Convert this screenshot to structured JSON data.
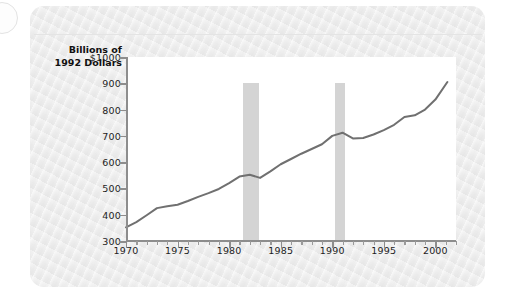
{
  "chart_data": {
    "type": "line",
    "title": "",
    "xlabel": "",
    "ylabel_lines": [
      "Billions of",
      "1992 Dollars"
    ],
    "xlim": [
      1970,
      2002
    ],
    "ylim": [
      300,
      1000
    ],
    "grid": false,
    "legend": null,
    "y_ticks": [
      {
        "value": 1000,
        "label": "$1000"
      },
      {
        "value": 900,
        "label": "900"
      },
      {
        "value": 800,
        "label": "800"
      },
      {
        "value": 700,
        "label": "700"
      },
      {
        "value": 600,
        "label": "600"
      },
      {
        "value": 500,
        "label": "500"
      },
      {
        "value": 400,
        "label": "400"
      },
      {
        "value": 300,
        "label": "300"
      }
    ],
    "x_ticks": [
      {
        "value": 1970,
        "label": "1970"
      },
      {
        "value": 1975,
        "label": "1975"
      },
      {
        "value": 1980,
        "label": "1980"
      },
      {
        "value": 1985,
        "label": "1985"
      },
      {
        "value": 1990,
        "label": "1990"
      },
      {
        "value": 1995,
        "label": "1995"
      },
      {
        "value": 2000,
        "label": "2000"
      }
    ],
    "x_minor_tick_step": 1,
    "series": [
      {
        "name": "Real output",
        "color": "#707070",
        "x": [
          1970,
          1971,
          1972,
          1973,
          1974,
          1975,
          1976,
          1977,
          1978,
          1979,
          1980,
          1981,
          1982,
          1983,
          1984,
          1985,
          1986,
          1987,
          1988,
          1989,
          1990,
          1991,
          1992,
          1993,
          1994,
          1995,
          1996,
          1997,
          1998,
          1999,
          2000
        ],
        "values": [
          352,
          372,
          398,
          425,
          432,
          438,
          452,
          468,
          482,
          498,
          520,
          545,
          552,
          540,
          565,
          592,
          612,
          632,
          650,
          668,
          700,
          712,
          690,
          692,
          705,
          722,
          742,
          772,
          778,
          800,
          838
        ]
      }
    ],
    "series_end_value": 905,
    "shaded_bands": [
      {
        "name": "recession-1981-1982",
        "x0": 1981.3,
        "x1": 1982.9,
        "color": "#d4d4d4"
      },
      {
        "name": "recession-1990-1991",
        "x0": 1990.3,
        "x1": 1991.2,
        "color": "#d4d4d4"
      }
    ]
  },
  "figure": {
    "card_background": "#ededed",
    "plot_background": "#ffffff",
    "axis_color": "#8d8d8d",
    "line_color": "#707070",
    "band_color": "#d4d4d4"
  }
}
